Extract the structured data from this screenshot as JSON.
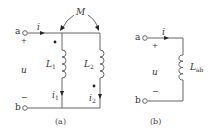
{
  "figure_a": {
    "caption": "(a)",
    "terminal_a": "a",
    "terminal_b": "b",
    "plus": "+",
    "minus": "−",
    "voltage": "u",
    "current": "i",
    "mutual": "M",
    "inductor1": {
      "name": "L",
      "sub": "1"
    },
    "inductor2": {
      "name": "L",
      "sub": "2"
    },
    "current1": {
      "name": "i",
      "sub": "1"
    },
    "current2": {
      "name": "i",
      "sub": "2"
    }
  },
  "figure_b": {
    "caption": "(b)",
    "terminal_a": "a",
    "terminal_b": "b",
    "plus": "+",
    "minus": "−",
    "voltage": "u",
    "current": "i",
    "inductor": {
      "name": "L",
      "sub": "ab"
    }
  },
  "colors": {
    "line": "#555555",
    "text": "#333333"
  }
}
